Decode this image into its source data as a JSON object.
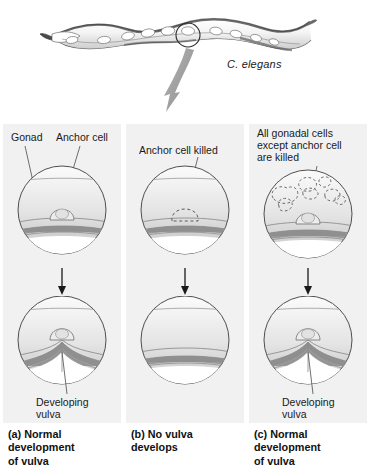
{
  "figure": {
    "organism_label": "C. elegans",
    "top_illustration": "c-elegans-worm-lateral-view-with-circled-vulval-region",
    "pointer_arrow": "large-gray-arrow-pointing-down-to-panels"
  },
  "panels": [
    {
      "id": "a",
      "top_labels": [
        "Gonad",
        "Anchor cell"
      ],
      "top_circle_state": "intact-gonad-with-anchor-cell",
      "arrow": "down-arrow",
      "bottom_label": "Developing\nvulva",
      "bottom_circle_state": "vulva-invagination-present",
      "caption": "(a)  Normal\ndevelopment\nof vulva"
    },
    {
      "id": "b",
      "top_labels": [
        "Anchor cell killed"
      ],
      "top_circle_state": "anchor-cell-ablated-dashed-outline",
      "arrow": "down-arrow",
      "bottom_label": "",
      "bottom_circle_state": "flat-surface-no-vulva",
      "caption": "(b)  No vulva\ndevelops"
    },
    {
      "id": "c",
      "top_labels": [
        "All gonadal cells\nexcept anchor cell\nare killed"
      ],
      "top_circle_state": "gonadal-cells-ablated-dashed-blobs-anchor-cell-intact",
      "arrow": "down-arrow",
      "bottom_label": "Developing\nvulva",
      "bottom_circle_state": "vulva-invagination-present",
      "caption": "(c)  Normal\ndevelopment\nof vulva"
    }
  ],
  "colors": {
    "panel_background": "#f1f1f1",
    "page_background": "#ffffff",
    "text": "#1a1a1a",
    "outline": "#555555",
    "cuticle_band": "#8a8a8a",
    "arrow_gray": "#9a9a9a"
  }
}
